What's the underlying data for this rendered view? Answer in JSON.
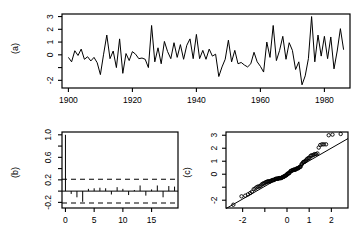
{
  "figure": {
    "background": "#ffffff",
    "ink": "#000000",
    "panel_labels": {
      "a": "(a)",
      "b": "(b)",
      "c": "(c)"
    }
  },
  "chart_data": [
    {
      "id": "panel-a",
      "panel_label": "(a)",
      "type": "line",
      "title": "",
      "xlabel": "",
      "ylabel": "",
      "grid": false,
      "legend": null,
      "xlim": [
        1898,
        1988
      ],
      "ylim": [
        -2.6,
        3.2
      ],
      "xticks": [
        1900,
        1920,
        1940,
        1960,
        1980
      ],
      "xtick_labels": [
        "1900",
        "1920",
        "1940",
        "1960",
        "1980"
      ],
      "yticks": [
        -2,
        -1,
        0,
        1,
        2,
        3
      ],
      "ytick_labels": [
        "-2",
        "",
        "0",
        "1",
        "2",
        "3"
      ],
      "x": [
        1900,
        1901,
        1902,
        1903,
        1904,
        1905,
        1906,
        1907,
        1908,
        1909,
        1910,
        1911,
        1912,
        1913,
        1914,
        1915,
        1916,
        1917,
        1918,
        1919,
        1920,
        1921,
        1922,
        1923,
        1924,
        1925,
        1926,
        1927,
        1928,
        1929,
        1930,
        1931,
        1932,
        1933,
        1934,
        1935,
        1936,
        1937,
        1938,
        1939,
        1940,
        1941,
        1942,
        1943,
        1944,
        1945,
        1946,
        1947,
        1948,
        1949,
        1950,
        1951,
        1952,
        1953,
        1954,
        1955,
        1956,
        1957,
        1958,
        1959,
        1960,
        1961,
        1962,
        1963,
        1964,
        1965,
        1966,
        1967,
        1968,
        1969,
        1970,
        1971,
        1972,
        1973,
        1974,
        1975,
        1976,
        1977,
        1978,
        1979,
        1980,
        1981,
        1982,
        1983,
        1984,
        1985,
        1986
      ],
      "y": [
        -0.2,
        -0.55,
        0.32,
        -0.05,
        0.45,
        -0.35,
        -0.15,
        -0.48,
        -0.2,
        -0.62,
        -1.55,
        0.05,
        1.55,
        -0.3,
        0.3,
        -1.0,
        1.25,
        -1.45,
        0.1,
        -0.45,
        0.25,
        0.05,
        -0.3,
        -0.25,
        -0.35,
        -1.0,
        2.3,
        -0.55,
        0.55,
        -0.7,
        1.05,
        0.25,
        -0.3,
        0.95,
        -0.2,
        0.8,
        -0.35,
        0.75,
        1.25,
        -0.3,
        1.6,
        -0.3,
        0.35,
        -0.35,
        0.45,
        -0.1,
        0.05,
        -1.7,
        -0.95,
        -0.35,
        1.15,
        -0.55,
        0.35,
        -0.7,
        -0.6,
        -0.8,
        -0.95,
        -0.7,
        0.2,
        -0.55,
        -0.9,
        -1.35,
        1.0,
        -0.2,
        2.3,
        -0.45,
        0.35,
        1.45,
        -0.35,
        0.95,
        0.35,
        -1.15,
        -0.55,
        -2.35,
        -1.65,
        -0.3,
        3.0,
        -0.55,
        1.55,
        -0.1,
        1.45,
        -0.3,
        1.4,
        -1.1,
        0.3,
        2.05,
        0.4
      ],
      "notes": "annual series, roughly stationary residual-like fluctuations"
    },
    {
      "id": "panel-b",
      "panel_label": "(b)",
      "type": "bar",
      "subtype": "acf",
      "title": "",
      "xlabel": "",
      "ylabel": "",
      "grid": false,
      "legend": null,
      "xlim": [
        -0.6,
        19.6
      ],
      "ylim": [
        -0.3,
        1.05
      ],
      "xticks": [
        0,
        5,
        10,
        15
      ],
      "xtick_labels": [
        "0",
        "5",
        "10",
        "15"
      ],
      "yticks": [
        -0.2,
        0.0,
        0.2,
        0.4,
        0.6,
        0.8,
        1.0
      ],
      "ytick_labels": [
        "-0.2",
        "",
        "0.2",
        "",
        "0.6",
        "",
        "1.0"
      ],
      "categories": [
        0,
        1,
        2,
        3,
        4,
        5,
        6,
        7,
        8,
        9,
        10,
        11,
        12,
        13,
        14,
        15,
        16,
        17,
        18,
        19
      ],
      "values": [
        1.0,
        -0.05,
        -0.11,
        -0.19,
        0.04,
        0.05,
        0.06,
        0.05,
        -0.06,
        0.07,
        0.04,
        -0.07,
        0.02,
        0.1,
        -0.08,
        0.03,
        0.1,
        -0.11,
        0.09,
        0.08
      ],
      "confidence_bounds": [
        0.21,
        -0.21
      ],
      "confidence_style": "dashed",
      "zero_line": 0.0
    },
    {
      "id": "panel-c",
      "panel_label": "(c)",
      "type": "scatter",
      "subtype": "qq-normal",
      "title": "",
      "xlabel": "",
      "ylabel": "",
      "grid": false,
      "legend": null,
      "xlim": [
        -2.75,
        2.75
      ],
      "ylim": [
        -2.6,
        3.25
      ],
      "xticks": [
        -2,
        -1,
        0,
        1,
        2
      ],
      "xtick_labels": [
        "-2",
        "",
        "0",
        "1",
        "2"
      ],
      "yticks": [
        -2,
        -1,
        0,
        1,
        2,
        3
      ],
      "ytick_labels": [
        "-2",
        "",
        "0",
        "1",
        "2",
        "3"
      ],
      "reference_line": {
        "intercept": 0.05,
        "slope": 0.98,
        "style": "solid"
      },
      "points_x": [
        -2.42,
        -2.05,
        -1.88,
        -1.76,
        -1.66,
        -1.58,
        -1.5,
        -1.43,
        -1.37,
        -1.31,
        -1.25,
        -1.2,
        -1.15,
        -1.1,
        -1.06,
        -1.01,
        -0.97,
        -0.93,
        -0.89,
        -0.86,
        -0.82,
        -0.78,
        -0.75,
        -0.72,
        -0.68,
        -0.65,
        -0.62,
        -0.59,
        -0.56,
        -0.53,
        -0.5,
        -0.47,
        -0.44,
        -0.41,
        -0.38,
        -0.36,
        -0.33,
        -0.3,
        -0.27,
        -0.25,
        -0.22,
        -0.19,
        -0.17,
        -0.14,
        -0.11,
        -0.09,
        -0.06,
        -0.03,
        -0.01,
        0.01,
        0.03,
        0.06,
        0.09,
        0.11,
        0.14,
        0.17,
        0.19,
        0.22,
        0.25,
        0.27,
        0.3,
        0.33,
        0.36,
        0.38,
        0.41,
        0.44,
        0.47,
        0.5,
        0.53,
        0.56,
        0.59,
        0.62,
        0.65,
        0.68,
        0.72,
        0.75,
        0.78,
        0.82,
        0.86,
        0.89,
        0.93,
        0.97,
        1.01,
        1.06,
        1.1,
        1.15,
        1.2,
        1.25,
        1.31,
        1.37,
        1.43,
        1.5,
        1.58,
        1.66,
        1.76,
        1.88,
        2.05,
        2.42
      ],
      "points_y": [
        -2.35,
        -1.7,
        -1.65,
        -1.55,
        -1.45,
        -1.35,
        -1.15,
        -1.1,
        -1.0,
        -0.95,
        -0.95,
        -0.9,
        -0.8,
        -0.75,
        -0.7,
        -0.7,
        -0.62,
        -0.6,
        -0.58,
        -0.55,
        -0.55,
        -0.55,
        -0.55,
        -0.5,
        -0.48,
        -0.45,
        -0.45,
        -0.45,
        -0.4,
        -0.38,
        -0.35,
        -0.35,
        -0.35,
        -0.35,
        -0.32,
        -0.3,
        -0.3,
        -0.3,
        -0.3,
        -0.28,
        -0.25,
        -0.22,
        -0.2,
        -0.2,
        -0.15,
        -0.12,
        -0.1,
        -0.08,
        -0.05,
        0.02,
        0.05,
        0.05,
        0.08,
        0.1,
        0.2,
        0.25,
        0.25,
        0.28,
        0.3,
        0.32,
        0.35,
        0.35,
        0.35,
        0.35,
        0.4,
        0.45,
        0.45,
        0.45,
        0.5,
        0.55,
        0.55,
        0.6,
        0.75,
        0.8,
        0.9,
        0.95,
        0.95,
        1.0,
        1.05,
        1.15,
        1.2,
        1.25,
        1.25,
        1.4,
        1.45,
        1.45,
        1.5,
        1.55,
        1.55,
        1.6,
        2.05,
        2.25,
        2.3,
        2.3,
        2.3,
        3.0,
        3.05,
        3.1
      ],
      "marker": "open-circle"
    }
  ]
}
